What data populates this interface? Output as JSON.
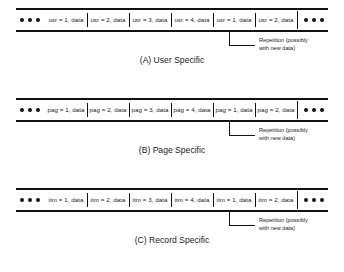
{
  "figure": {
    "ellipsis_icon": "ellipsis-dots",
    "leader_icon": "elbow-leader-line"
  },
  "panels": [
    {
      "id": "user-specific",
      "caption": "(A) User Specific",
      "cells": [
        "usr = 1, data",
        "usr = 2, data",
        "usr = 3, data",
        "usr = 4, data",
        "usr = 1, data",
        "usr = 2, data"
      ],
      "annotation": {
        "line1": "Repetition (possibly",
        "line2": "with new data)"
      }
    },
    {
      "id": "page-specific",
      "caption": "(B) Page Specific",
      "cells": [
        "pag = 1, data",
        "pag = 2, data",
        "pag = 3, data",
        "pag = 4, data",
        "pag = 1, data",
        "pag = 2, data"
      ],
      "annotation": {
        "line1": "Repetition (possibly",
        "line2": "with new data)"
      }
    },
    {
      "id": "record-specific",
      "caption": "(C) Record Specific",
      "cells": [
        "itm = 1, data",
        "itm = 2, data",
        "itm = 3, data",
        "itm = 4, data",
        "itm = 1, data",
        "itm = 2, data"
      ],
      "annotation": {
        "line1": "Repetition (possibly",
        "line2": "with new data)"
      }
    }
  ]
}
